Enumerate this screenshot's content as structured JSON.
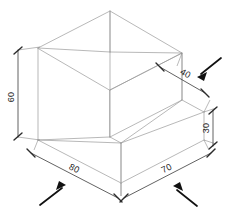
{
  "drawing": {
    "type": "isometric-engineering-drawing",
    "title": "Stepped L-block isometric view",
    "background_color": "#ffffff",
    "object_line_color": "#9a9a9a",
    "dimension_line_color": "#3a3a3a",
    "text_color": "#1c1c1c",
    "pointer_color": "#111111",
    "shape": "L-shaped stepped rectangular block",
    "projection": "isometric"
  },
  "dimensions": [
    {
      "id": "height-60",
      "value": "60",
      "label": "60",
      "placement": "left",
      "orientation": "vertical",
      "rotation_deg": -90,
      "measures": "overall height of tall back wall"
    },
    {
      "id": "depth-40",
      "value": "40",
      "label": "40",
      "placement": "upper-right",
      "orientation": "isometric-receding",
      "rotation_deg": 30,
      "measures": "depth of lower step platform"
    },
    {
      "id": "height-30",
      "value": "30",
      "label": "30",
      "placement": "right",
      "orientation": "vertical",
      "rotation_deg": -90,
      "measures": "height of lower step"
    },
    {
      "id": "width-80",
      "value": "80",
      "label": "80",
      "placement": "bottom-left",
      "orientation": "isometric-left",
      "rotation_deg": 30,
      "measures": "base length along left bottom edge"
    },
    {
      "id": "width-70",
      "value": "70",
      "label": "70",
      "placement": "bottom-right",
      "orientation": "isometric-right",
      "rotation_deg": -30,
      "measures": "base length along right bottom edge"
    }
  ],
  "pointers": [
    {
      "id": "pointer-upper-right",
      "direction": "down-left",
      "target_dimension": "depth-40"
    },
    {
      "id": "pointer-bottom-left",
      "direction": "up-right",
      "target_dimension": "width-80"
    },
    {
      "id": "pointer-bottom-right",
      "direction": "up-left",
      "target_dimension": "width-70"
    }
  ]
}
